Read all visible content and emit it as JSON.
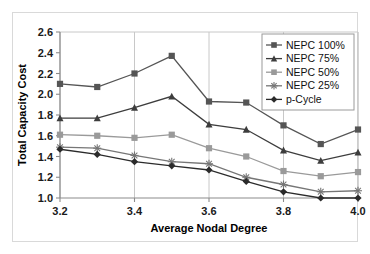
{
  "chart_data": {
    "type": "line",
    "title": "",
    "xlabel": "Average Nodal Degree",
    "ylabel": "Total Capacity Cost",
    "x": [
      3.2,
      3.3,
      3.4,
      3.5,
      3.6,
      3.7,
      3.8,
      3.9,
      4.0
    ],
    "xlim": [
      3.2,
      4.0
    ],
    "ylim": [
      1.0,
      2.6
    ],
    "xticks": [
      3.2,
      3.4,
      3.6,
      3.8,
      4.0
    ],
    "xtick_labels": [
      "3.2",
      "3.4",
      "3.6",
      "3.8",
      "4.0"
    ],
    "yticks": [
      1.0,
      1.2,
      1.4,
      1.6,
      1.8,
      2.0,
      2.2,
      2.4,
      2.6
    ],
    "ytick_labels": [
      "1.0",
      "1.2",
      "1.4",
      "1.6",
      "1.8",
      "2.0",
      "2.2",
      "2.4",
      "2.6"
    ],
    "grid": "vertical-major",
    "legend_position": "top-right",
    "series": [
      {
        "name": "NEPC 100%",
        "marker": "square",
        "color": "#555555",
        "values": [
          2.1,
          2.07,
          2.2,
          2.37,
          1.93,
          1.92,
          1.7,
          1.52,
          1.66
        ]
      },
      {
        "name": "NEPC 75%",
        "marker": "triangle",
        "color": "#3d3d3d",
        "values": [
          1.77,
          1.77,
          1.87,
          1.98,
          1.71,
          1.66,
          1.46,
          1.36,
          1.44
        ]
      },
      {
        "name": "NEPC 50%",
        "marker": "square",
        "color": "#9a9a9a",
        "values": [
          1.61,
          1.6,
          1.58,
          1.61,
          1.48,
          1.4,
          1.26,
          1.21,
          1.25
        ]
      },
      {
        "name": "NEPC 25%",
        "marker": "asterisk",
        "color": "#767676",
        "values": [
          1.49,
          1.48,
          1.41,
          1.35,
          1.33,
          1.2,
          1.13,
          1.06,
          1.07
        ]
      },
      {
        "name": "p-Cycle",
        "marker": "diamond",
        "color": "#2b2b2b",
        "values": [
          1.47,
          1.42,
          1.35,
          1.31,
          1.27,
          1.16,
          1.06,
          1.0,
          1.0
        ]
      }
    ]
  }
}
